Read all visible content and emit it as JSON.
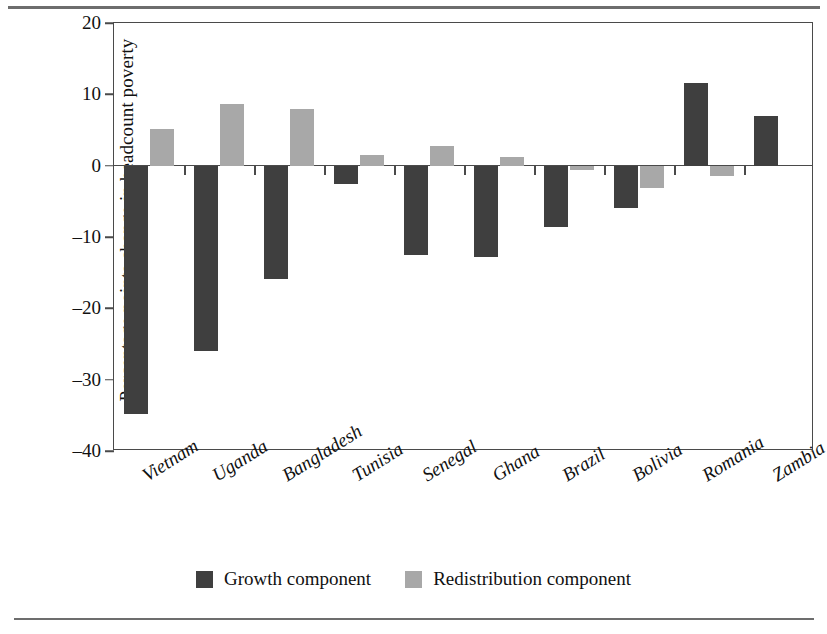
{
  "figure": {
    "background": "#ffffff",
    "frame_color": "#4a4a4a",
    "rule_color": "#6d6d6d"
  },
  "legend": {
    "position": "bottom-center",
    "items": [
      {
        "label": "Growth component",
        "color": "#3f3f3f",
        "swatch": "square-swatch"
      },
      {
        "label": "Redistribution component",
        "color": "#a8a8a8",
        "swatch": "square-swatch"
      }
    ]
  },
  "chart_data": {
    "type": "bar",
    "title": "",
    "xlabel": "",
    "ylabel": "Percentage points change in headcount poverty",
    "ylim": [
      -40,
      20
    ],
    "yticks": [
      20,
      10,
      0,
      -10,
      -20,
      -30,
      -40
    ],
    "ytick_labels": [
      "20",
      "10",
      "0",
      "–10",
      "–20",
      "–30",
      "–40"
    ],
    "grid": false,
    "legend_position": "bottom-center",
    "categories": [
      "Vietnam",
      "Uganda",
      "Bangladesh",
      "Tunisia",
      "Senegal",
      "Ghana",
      "Brazil",
      "Bolivia",
      "Romania",
      "Zambia"
    ],
    "series": [
      {
        "name": "Growth component",
        "color": "#3f3f3f",
        "values": [
          -34.8,
          -26.0,
          -15.9,
          -2.6,
          -12.5,
          -12.8,
          -8.6,
          -5.9,
          11.6,
          6.9
        ]
      },
      {
        "name": "Redistribution component",
        "color": "#a8a8a8",
        "values": [
          5.1,
          8.7,
          8.0,
          1.5,
          2.7,
          1.2,
          -0.6,
          -3.1,
          -1.5,
          0.0
        ]
      }
    ]
  }
}
